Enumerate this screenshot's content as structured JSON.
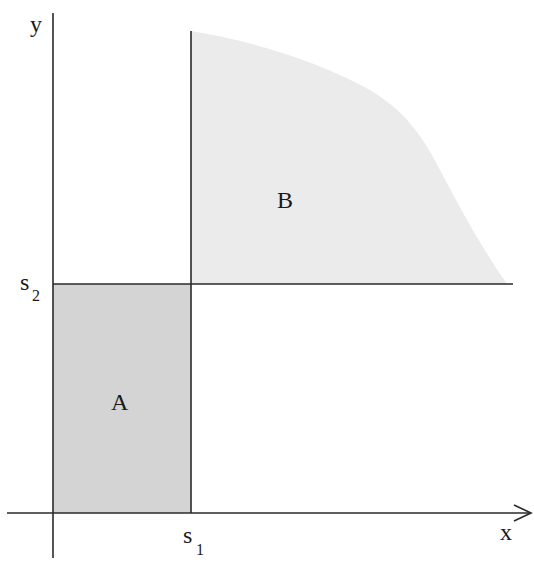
{
  "diagram": {
    "type": "region-diagram",
    "axes": {
      "x_label": "x",
      "y_label": "y"
    },
    "thresholds": {
      "s1": {
        "symbol": "s",
        "subscript": "1"
      },
      "s2": {
        "symbol": "s",
        "subscript": "2"
      }
    },
    "regions": [
      {
        "id": "A",
        "label": "A",
        "description": "rectangle from origin to (s1, s2)",
        "fill": "#d4d4d4"
      },
      {
        "id": "B",
        "label": "B",
        "description": "region above s2 and right of s1, bounded by a decreasing curve",
        "fill": "#ebebeb"
      }
    ],
    "colors": {
      "line": "#2a2a2a",
      "region_a": "#d4d4d4",
      "region_b": "#ebebeb",
      "background": "#ffffff"
    }
  }
}
